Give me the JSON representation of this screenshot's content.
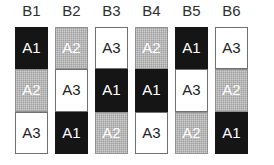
{
  "figure": {
    "title": "",
    "background_color": "#ffffff",
    "column_label_color": "#2b2b2b"
  },
  "legend_colors": {
    "A1": "#111111",
    "A2": "#b4b4b4",
    "A3": "#ffffff"
  },
  "chart_data": {
    "type": "table",
    "title": "",
    "xlabel": "",
    "ylabel": "",
    "grid": false,
    "legend": "none",
    "categories": [
      "B1",
      "B2",
      "B3",
      "B4",
      "B5",
      "B6"
    ],
    "row_positions": [
      1,
      2,
      3
    ],
    "levels": [
      "A1",
      "A2",
      "A3"
    ],
    "level_fills": {
      "A1": "black",
      "A2": "gray",
      "A3": "white"
    },
    "columns": [
      {
        "label": "B1",
        "cells": [
          {
            "label": "A1",
            "fill": "black"
          },
          {
            "label": "A2",
            "fill": "gray"
          },
          {
            "label": "A3",
            "fill": "white"
          }
        ]
      },
      {
        "label": "B2",
        "cells": [
          {
            "label": "A2",
            "fill": "gray"
          },
          {
            "label": "A3",
            "fill": "white"
          },
          {
            "label": "A1",
            "fill": "black"
          }
        ]
      },
      {
        "label": "B3",
        "cells": [
          {
            "label": "A3",
            "fill": "white"
          },
          {
            "label": "A1",
            "fill": "black"
          },
          {
            "label": "A2",
            "fill": "gray"
          }
        ]
      },
      {
        "label": "B4",
        "cells": [
          {
            "label": "A2",
            "fill": "gray"
          },
          {
            "label": "A1",
            "fill": "black"
          },
          {
            "label": "A3",
            "fill": "white"
          }
        ]
      },
      {
        "label": "B5",
        "cells": [
          {
            "label": "A1",
            "fill": "black"
          },
          {
            "label": "A3",
            "fill": "white"
          },
          {
            "label": "A2",
            "fill": "gray"
          }
        ]
      },
      {
        "label": "B6",
        "cells": [
          {
            "label": "A3",
            "fill": "white"
          },
          {
            "label": "A2",
            "fill": "gray"
          },
          {
            "label": "A1",
            "fill": "black"
          }
        ]
      }
    ]
  }
}
